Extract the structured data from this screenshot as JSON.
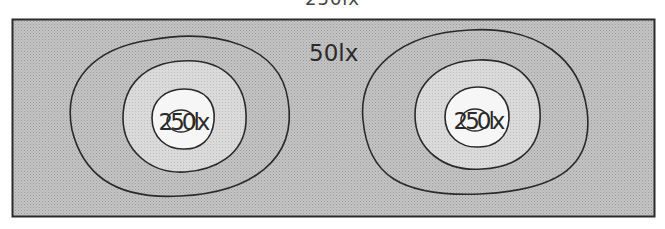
{
  "diagram": {
    "caption": "250lx",
    "background_color": "#ffffff",
    "frame": {
      "stroke": "#2b2b2b",
      "fill": "#b9b9b9"
    },
    "zones": {
      "outer": {
        "label": "50lx",
        "fill": "#b9b9b9"
      },
      "middle": {
        "fill": "#d0d0d0"
      },
      "inner": {
        "fill": "#e6e6e6"
      },
      "center": {
        "fill": "#fafafa"
      }
    },
    "sources": [
      {
        "label": "250lx"
      },
      {
        "label": "250lx"
      }
    ],
    "outer_label": "50lx"
  }
}
